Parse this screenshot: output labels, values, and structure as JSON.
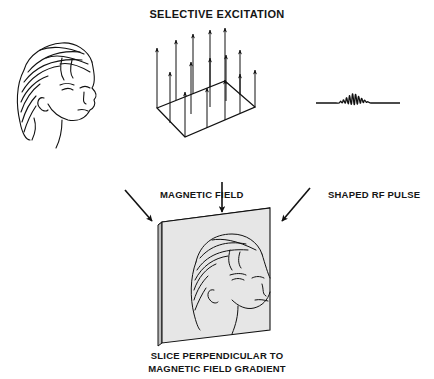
{
  "title": "SELECTIVE EXCITATION",
  "labels": {
    "magnetic_field": "MAGNETIC FIELD",
    "rf_pulse": "SHAPED RF PULSE",
    "slice_line1": "SLICE PERPENDICULAR TO",
    "slice_line2": "MAGNETIC FIELD GRADIENT"
  },
  "elements": {
    "head": "head-profile-drawing",
    "field": "magnetic-field-vector-grid",
    "pulse": "shaped-rf-pulse-waveform",
    "slice": "slice-slab-with-head"
  },
  "colors": {
    "ink": "#111111",
    "slab": "#e6e6e6",
    "slab_edge": "#cfcfcf",
    "background": "#ffffff"
  }
}
